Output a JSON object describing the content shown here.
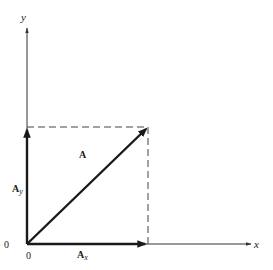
{
  "diagram": {
    "type": "vector-decomposition",
    "colors": {
      "ink": "#1a1a1a",
      "axis": "#333333",
      "dashed": "#444444",
      "background": "#ffffff"
    },
    "axes": {
      "x_label": "x",
      "y_label": "y",
      "origin_label_left": "0",
      "origin_label_below": "0"
    },
    "vectors": {
      "resultant": {
        "label": "A"
      },
      "x_component": {
        "label": "A",
        "subscript": "x"
      },
      "y_component": {
        "label": "A",
        "subscript": "y"
      }
    },
    "projection_lines": "dashed"
  }
}
